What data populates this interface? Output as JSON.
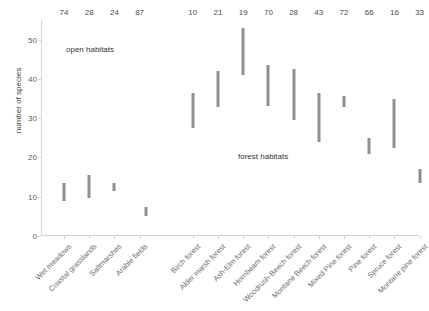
{
  "chart_data": {
    "type": "bar",
    "title": "",
    "subtitle": "",
    "xlabel": "",
    "ylabel": "number of species",
    "ylim": [
      0,
      55
    ],
    "yticks": [
      0,
      10,
      20,
      30,
      40,
      50
    ],
    "grid": false,
    "legend_position": "none",
    "bar_style": "floating range bars (min-max of species richness)",
    "categories": [
      "Wet meadows",
      "Coastal grasslands",
      "Saltmarshes",
      "Arable fields",
      "Birch forest",
      "Alder marsh forest",
      "Ash-Elm forest",
      "Hornbeam forest",
      "Woodrush-Beech forest",
      "Montane Beech forest",
      "Mixed Pine forest",
      "Pine forest",
      "Spruce forest",
      "Montane pine forest"
    ],
    "groups": [
      {
        "name": "open habitats",
        "categories": [
          0,
          1,
          2,
          3
        ]
      },
      {
        "name": "forest habitats",
        "categories": [
          4,
          5,
          6,
          7,
          8,
          9,
          10,
          11,
          12,
          13
        ]
      }
    ],
    "series": [
      {
        "name": "low",
        "values": [
          9.0,
          9.8,
          11.5,
          5.0,
          27.6,
          32.8,
          41.0,
          33.0,
          29.6,
          24.0,
          32.9,
          21.0,
          22.5,
          13.4
        ]
      },
      {
        "name": "high",
        "values": [
          13.4,
          15.5,
          13.5,
          7.4,
          36.5,
          42.1,
          53.0,
          43.5,
          42.5,
          36.4,
          35.6,
          25.0,
          35.0,
          17.0
        ]
      }
    ],
    "top_value_label": "number of samples",
    "top_values": [
      74,
      28,
      24,
      87,
      10,
      21,
      19,
      70,
      28,
      43,
      72,
      66,
      16,
      33
    ]
  },
  "colors": {
    "bar": "#8f8f8f",
    "axis": "#d4d4d4",
    "tick_text": "#606060",
    "category_text": "#6d6d6d",
    "annotation_text": "#333333",
    "top_value_text": "#4a4a4a",
    "background": "#ffffff"
  }
}
